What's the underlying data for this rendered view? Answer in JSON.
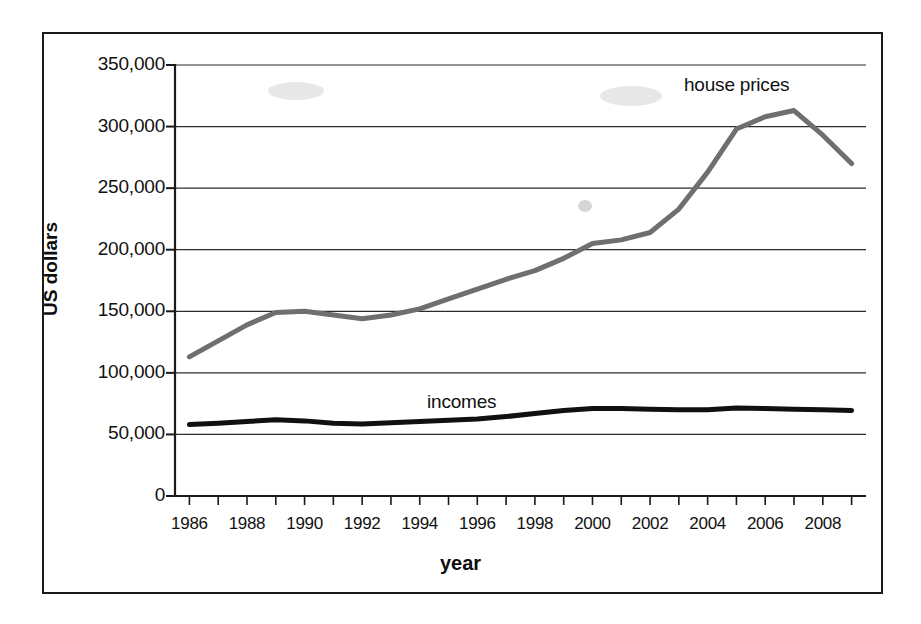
{
  "chart_data": {
    "type": "line",
    "title": "",
    "xlabel": "year",
    "ylabel": "US dollars",
    "xlim": [
      1985.5,
      2009.5
    ],
    "ylim": [
      0,
      350000
    ],
    "grid": true,
    "legend_position": "inline-annotation",
    "ytick_labels": [
      "350,000",
      "300,000",
      "250,000",
      "200,000",
      "150,000",
      "100,000",
      "50,000",
      "0"
    ],
    "ytick_values": [
      350000,
      300000,
      250000,
      200000,
      150000,
      100000,
      50000,
      0
    ],
    "xtick_labels": [
      "1986",
      "1988",
      "1990",
      "1992",
      "1994",
      "1996",
      "1998",
      "2000",
      "2002",
      "2004",
      "2006",
      "2008"
    ],
    "xtick_values": [
      1986,
      1988,
      1990,
      1992,
      1994,
      1996,
      1998,
      2000,
      2002,
      2004,
      2006,
      2008
    ],
    "x": [
      1986,
      1987,
      1988,
      1989,
      1990,
      1991,
      1992,
      1993,
      1994,
      1995,
      1996,
      1997,
      1998,
      1999,
      2000,
      2001,
      2002,
      2003,
      2004,
      2005,
      2006,
      2007,
      2008,
      2009
    ],
    "series": [
      {
        "name": "house prices",
        "color": "#6f6f6f",
        "width": 5,
        "values": [
          113000,
          126000,
          139000,
          149000,
          150000,
          147000,
          144000,
          147000,
          152000,
          160000,
          168000,
          176000,
          183000,
          193000,
          205000,
          208000,
          214000,
          233000,
          263000,
          298000,
          308000,
          313000,
          293000,
          270000
        ]
      },
      {
        "name": "incomes",
        "color": "#101010",
        "width": 5,
        "values": [
          58000,
          59000,
          60500,
          62000,
          61000,
          59000,
          58500,
          59500,
          60500,
          61500,
          62500,
          64500,
          67000,
          69500,
          71000,
          71000,
          70500,
          70000,
          70000,
          71500,
          71000,
          70500,
          70000,
          69500
        ]
      }
    ],
    "annotations": [
      {
        "text": "house prices",
        "series": "house prices"
      },
      {
        "text": "incomes",
        "series": "incomes"
      }
    ]
  }
}
